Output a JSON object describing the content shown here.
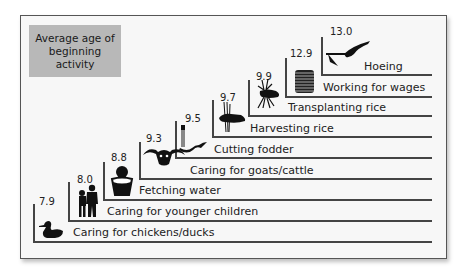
{
  "legend": {
    "text": "Average age of beginning activity"
  },
  "steps": [
    {
      "age": "7.9",
      "activity": "Caring for chickens/ducks",
      "icon": "duck-icon"
    },
    {
      "age": "8.0",
      "activity": "Caring for younger children",
      "icon": "children-icon"
    },
    {
      "age": "8.8",
      "activity": "Fetching water",
      "icon": "water-pot-icon"
    },
    {
      "age": "9.3",
      "activity": "Caring for goats/cattle",
      "icon": "cattle-head-icon"
    },
    {
      "age": "9.5",
      "activity": "Cutting fodder",
      "icon": "sickle-icon"
    },
    {
      "age": "9.7",
      "activity": "Harvesting rice",
      "icon": "rice-sheaf-icon"
    },
    {
      "age": "9.9",
      "activity": "Transplanting rice",
      "icon": "rice-seedling-icon"
    },
    {
      "age": "12.9",
      "activity": "Working for wages",
      "icon": "coin-stack-icon"
    },
    {
      "age": "13.0",
      "activity": "Hoeing",
      "icon": "hoe-icon"
    }
  ],
  "colors": {
    "frame_bg": "#f7f7f7",
    "legend_bg": "#b8b8b8",
    "line": "#444444"
  }
}
